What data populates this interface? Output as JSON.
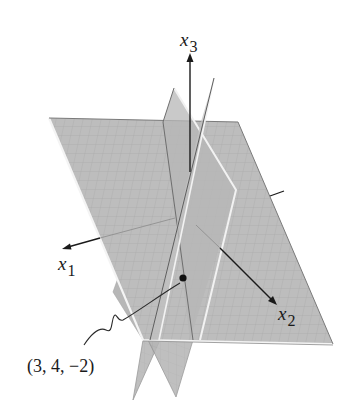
{
  "figure": {
    "axes": {
      "x1": {
        "label": "x",
        "subscript": "1"
      },
      "x2": {
        "label": "x",
        "subscript": "2"
      },
      "x3": {
        "label": "x",
        "subscript": "3"
      }
    },
    "point": {
      "label": "(3, 4, −2)",
      "coords": [
        3,
        4,
        -2
      ]
    },
    "colors": {
      "plane_fill": "#b9b9b9",
      "plane_edge": "#f2f2f2",
      "grid": "#9a9a9a",
      "axis": "#1a1a1a",
      "background": "#ffffff"
    }
  }
}
